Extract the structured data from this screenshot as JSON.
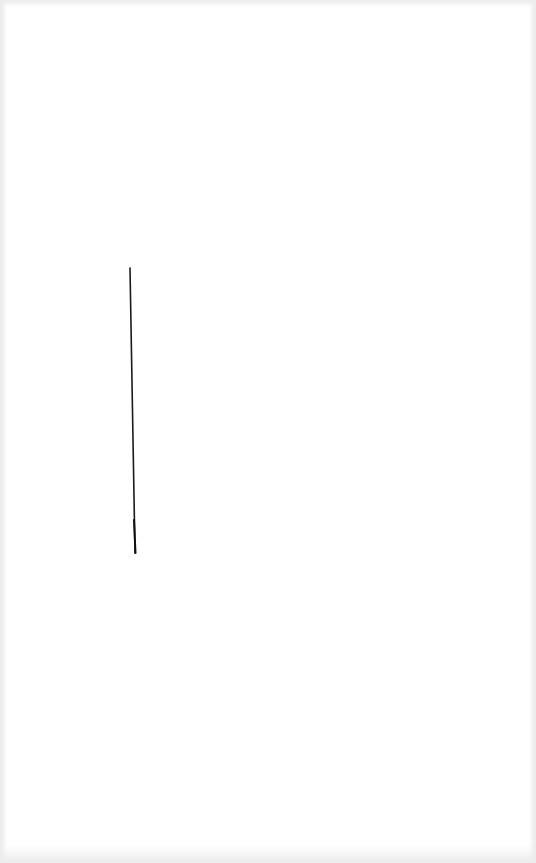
{
  "page": {
    "background_color": "#ffffff",
    "edge_tint_color": "#ececec"
  },
  "marks": [
    {
      "kind": "pen-stroke",
      "orientation": "near-vertical",
      "color": "#1a1a1a"
    }
  ]
}
